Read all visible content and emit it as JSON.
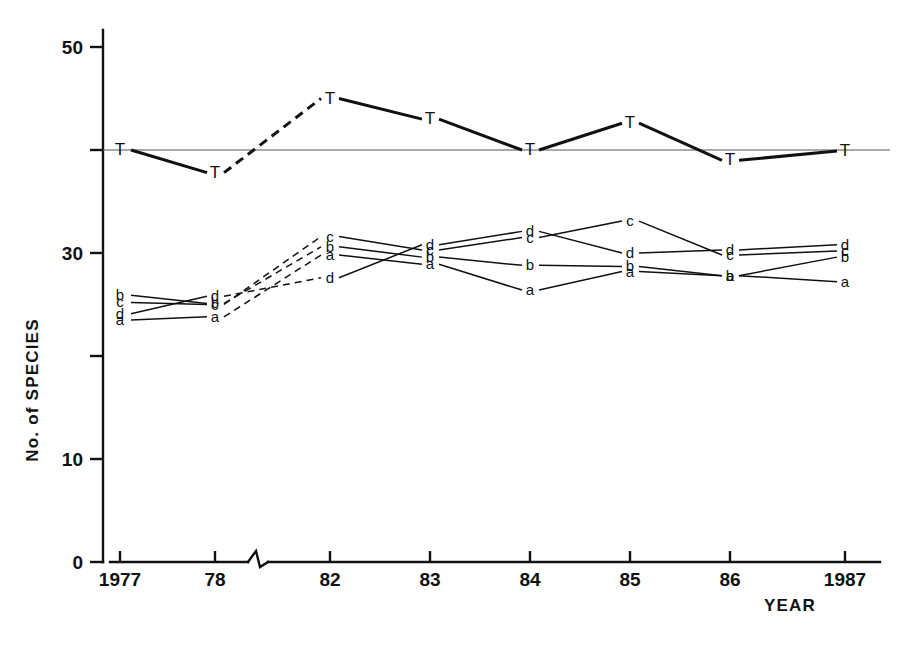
{
  "chart_data": {
    "type": "line",
    "title": "",
    "xlabel": "YEAR",
    "ylabel": "No. of SPECIES",
    "categories": [
      "1977",
      "78",
      "82",
      "83",
      "84",
      "85",
      "86",
      "1987"
    ],
    "x_tick_labels": [
      "1977",
      "78",
      "82",
      "83",
      "84",
      "85",
      "86",
      "1987"
    ],
    "y_tick_labels": [
      "0",
      "10",
      "30",
      "50"
    ],
    "y_ticks_all": [
      0,
      10,
      20,
      30,
      40,
      50
    ],
    "ylim": [
      0,
      53
    ],
    "grid": false,
    "legend": "inline point labels",
    "axis_break_between": [
      "78",
      "82"
    ],
    "reference_line_value": 40,
    "series": [
      {
        "name": "T",
        "marker_label": "T",
        "line_style": "solid-with-dashed-gap",
        "values": [
          40.0,
          37.8,
          45.0,
          43.0,
          40.0,
          42.6,
          39.0,
          39.9
        ]
      },
      {
        "name": "a",
        "marker_label": "a",
        "line_style": "solid-with-dashed-gap",
        "values": [
          23.5,
          23.8,
          29.8,
          28.9,
          26.4,
          28.2,
          27.8,
          27.2
        ]
      },
      {
        "name": "b",
        "marker_label": "b",
        "line_style": "solid-with-dashed-gap",
        "values": [
          25.9,
          25.1,
          30.6,
          29.6,
          28.8,
          28.7,
          27.8,
          29.6
        ]
      },
      {
        "name": "c",
        "marker_label": "c",
        "line_style": "solid-with-dashed-gap",
        "values": [
          25.2,
          25.0,
          31.6,
          30.3,
          31.5,
          33.1,
          29.8,
          30.2
        ]
      },
      {
        "name": "d",
        "marker_label": "d",
        "line_style": "solid-with-dashed-gap",
        "values": [
          24.1,
          25.8,
          27.6,
          30.8,
          32.1,
          30.0,
          30.3,
          30.8
        ]
      }
    ]
  }
}
